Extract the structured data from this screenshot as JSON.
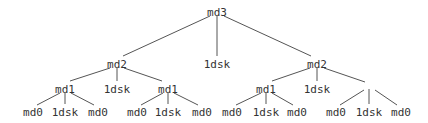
{
  "diagram": {
    "type": "tree",
    "colors": {
      "text": "#333333",
      "edge": "#555555",
      "background": "#ffffff"
    },
    "nodes": [
      {
        "id": "n0",
        "label": "md3",
        "x": 217,
        "y": 12
      },
      {
        "id": "n1",
        "label": "md2",
        "x": 117,
        "y": 64
      },
      {
        "id": "n2",
        "label": "1dsk",
        "x": 217,
        "y": 64
      },
      {
        "id": "n3",
        "label": "md2",
        "x": 317,
        "y": 64
      },
      {
        "id": "n4",
        "label": "md1",
        "x": 65,
        "y": 89
      },
      {
        "id": "n5",
        "label": "1dsk",
        "x": 117,
        "y": 89
      },
      {
        "id": "n6",
        "label": "md1",
        "x": 168,
        "y": 89
      },
      {
        "id": "n7",
        "label": "md1",
        "x": 266,
        "y": 89
      },
      {
        "id": "n8",
        "label": "1dsk",
        "x": 317,
        "y": 89
      },
      {
        "id": "n9",
        "label": "",
        "x": 369,
        "y": 89
      },
      {
        "id": "n10",
        "label": "md0",
        "x": 33,
        "y": 112
      },
      {
        "id": "n11",
        "label": "1dsk",
        "x": 65,
        "y": 112
      },
      {
        "id": "n12",
        "label": "md0",
        "x": 98,
        "y": 112
      },
      {
        "id": "n13",
        "label": "md0",
        "x": 137,
        "y": 112
      },
      {
        "id": "n14",
        "label": "1dsk",
        "x": 168,
        "y": 112
      },
      {
        "id": "n15",
        "label": "md0",
        "x": 202,
        "y": 112
      },
      {
        "id": "n16",
        "label": "md0",
        "x": 232,
        "y": 112
      },
      {
        "id": "n17",
        "label": "1dsk",
        "x": 266,
        "y": 112
      },
      {
        "id": "n18",
        "label": "md0",
        "x": 297,
        "y": 112
      },
      {
        "id": "n19",
        "label": "md0",
        "x": 336,
        "y": 112
      },
      {
        "id": "n20",
        "label": "1dsk",
        "x": 369,
        "y": 112
      },
      {
        "id": "n21",
        "label": "md0",
        "x": 401,
        "y": 112
      }
    ],
    "edges": [
      {
        "x1": 210,
        "y1": 16,
        "x2": 123,
        "y2": 56
      },
      {
        "x1": 217,
        "y1": 16,
        "x2": 217,
        "y2": 56
      },
      {
        "x1": 224,
        "y1": 16,
        "x2": 311,
        "y2": 56
      },
      {
        "x1": 110,
        "y1": 68,
        "x2": 70,
        "y2": 81
      },
      {
        "x1": 117,
        "y1": 68,
        "x2": 117,
        "y2": 81
      },
      {
        "x1": 124,
        "y1": 68,
        "x2": 162,
        "y2": 81
      },
      {
        "x1": 310,
        "y1": 68,
        "x2": 272,
        "y2": 81
      },
      {
        "x1": 317,
        "y1": 68,
        "x2": 317,
        "y2": 81
      },
      {
        "x1": 324,
        "y1": 68,
        "x2": 365,
        "y2": 82
      },
      {
        "x1": 60,
        "y1": 93,
        "x2": 37,
        "y2": 105
      },
      {
        "x1": 65,
        "y1": 93,
        "x2": 65,
        "y2": 104
      },
      {
        "x1": 71,
        "y1": 93,
        "x2": 94,
        "y2": 105
      },
      {
        "x1": 163,
        "y1": 93,
        "x2": 141,
        "y2": 105
      },
      {
        "x1": 168,
        "y1": 93,
        "x2": 168,
        "y2": 104
      },
      {
        "x1": 174,
        "y1": 93,
        "x2": 198,
        "y2": 105
      },
      {
        "x1": 261,
        "y1": 93,
        "x2": 236,
        "y2": 105
      },
      {
        "x1": 266,
        "y1": 93,
        "x2": 266,
        "y2": 104
      },
      {
        "x1": 272,
        "y1": 93,
        "x2": 293,
        "y2": 105
      },
      {
        "x1": 364,
        "y1": 90,
        "x2": 340,
        "y2": 105
      },
      {
        "x1": 369,
        "y1": 89,
        "x2": 369,
        "y2": 104
      },
      {
        "x1": 375,
        "y1": 90,
        "x2": 397,
        "y2": 105
      }
    ]
  }
}
